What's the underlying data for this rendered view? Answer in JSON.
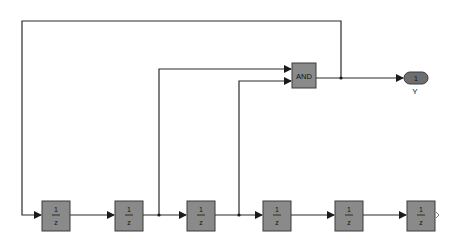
{
  "diagram": {
    "type": "simulink-block-diagram",
    "logic_block": {
      "label": "AND"
    },
    "outport": {
      "number": "1",
      "name": "Y"
    },
    "delay_blocks": [
      {
        "numerator": "1",
        "denominator": "z"
      },
      {
        "numerator": "1",
        "denominator": "z"
      },
      {
        "numerator": "1",
        "denominator": "z"
      },
      {
        "numerator": "1",
        "denominator": "z"
      },
      {
        "numerator": "1",
        "denominator": "z"
      },
      {
        "numerator": "1",
        "denominator": "z"
      }
    ]
  }
}
